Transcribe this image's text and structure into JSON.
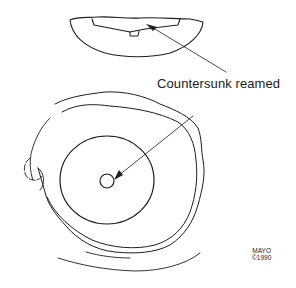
{
  "figure": {
    "annotation": {
      "label": "Countersunk reamed"
    },
    "credit": {
      "line1": "MAYO",
      "line2": "©1990"
    },
    "colors": {
      "ink": "#1e1e1e",
      "background": "#ffffff"
    }
  }
}
